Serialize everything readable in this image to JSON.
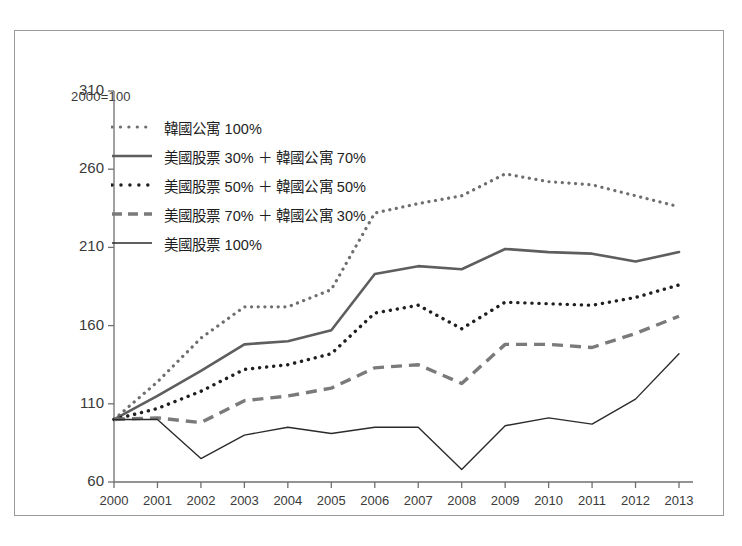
{
  "chart_data": {
    "type": "line",
    "title": "",
    "subtitle": "",
    "note": "2000=100",
    "xlabel": "",
    "ylabel": "",
    "grid": false,
    "legend_position": "top-left",
    "x": [
      2000,
      2001,
      2002,
      2003,
      2004,
      2005,
      2006,
      2007,
      2008,
      2009,
      2010,
      2011,
      2012,
      2013
    ],
    "categories": [
      "2000",
      "2001",
      "2002",
      "2003",
      "2004",
      "2005",
      "2006",
      "2007",
      "2008",
      "2009",
      "2010",
      "2011",
      "2012",
      "2013"
    ],
    "xlim": [
      2000,
      2013
    ],
    "ylim": [
      60,
      310
    ],
    "yticks": [
      60,
      110,
      160,
      210,
      260,
      310
    ],
    "ytick_labels": [
      "60",
      "110",
      "160",
      "210",
      "260",
      "310"
    ],
    "series": [
      {
        "name": "韓國公寓 100%",
        "style": "dotted",
        "color": "#6e6e6e",
        "width": 3.2,
        "values": [
          100,
          124,
          152,
          172,
          172,
          183,
          232,
          238,
          243,
          257,
          252,
          250,
          243,
          236
        ]
      },
      {
        "name": "美國股票 30% ＋ 韓國公寓 70%",
        "style": "solid",
        "color": "#5e5e5e",
        "width": 2.6,
        "values": [
          100,
          115,
          131,
          148,
          150,
          157,
          193,
          198,
          196,
          209,
          207,
          206,
          201,
          207
        ]
      },
      {
        "name": "美國股票 50% ＋ 韓國公寓 50%",
        "style": "dotted",
        "color": "#1f1f1f",
        "width": 3.4,
        "values": [
          100,
          107,
          118,
          132,
          135,
          142,
          168,
          173,
          158,
          175,
          174,
          173,
          178,
          186
        ]
      },
      {
        "name": "美國股票 70% ＋ 韓國公寓 30%",
        "style": "dashed",
        "color": "#7a7a7a",
        "width": 3.4,
        "values": [
          100,
          101,
          98,
          112,
          115,
          120,
          133,
          135,
          123,
          148,
          148,
          146,
          155,
          166
        ]
      },
      {
        "name": "美國股票 100%",
        "style": "solid",
        "color": "#2b2b2b",
        "width": 1.4,
        "values": [
          100,
          100,
          75,
          90,
          95,
          91,
          95,
          95,
          68,
          96,
          101,
          97,
          113,
          142
        ]
      }
    ]
  },
  "legend": {
    "items": [
      {
        "label": "韓國公寓 100%"
      },
      {
        "label": "美國股票 30% ＋ 韓國公寓 70%"
      },
      {
        "label": "美國股票 50% ＋ 韓國公寓 50%"
      },
      {
        "label": "美國股票 70% ＋ 韓國公寓 30%"
      },
      {
        "label": "美國股票 100%"
      }
    ]
  },
  "colors": {
    "frame": "#9a9a9a",
    "axis": "#6f6f6f",
    "text": "#3a3a3a",
    "background": "#ffffff"
  }
}
